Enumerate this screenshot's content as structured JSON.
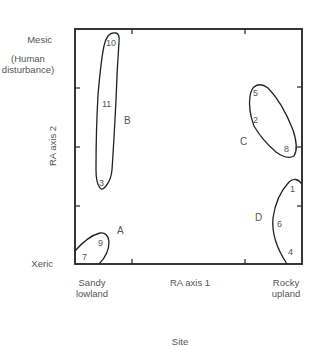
{
  "labels": {
    "y_top": "Mesic",
    "y_top_note": "(Human disturbance)",
    "y_top_note_line1": "(Human",
    "y_top_note_line2": "disturbance)",
    "y_bottom": "Xeric",
    "y_axis": "RA axis 2",
    "x_left_line1": "Sandy",
    "x_left_line2": "lowland",
    "x_axis": "RA axis 1",
    "x_right_line1": "Rocky",
    "x_right_line2": "upland",
    "x_title": "Site"
  },
  "groups": [
    {
      "name": "A",
      "points": [
        "7",
        "9"
      ]
    },
    {
      "name": "B",
      "points": [
        "10",
        "11",
        "3"
      ]
    },
    {
      "name": "C",
      "points": [
        "5",
        "2",
        "8"
      ]
    },
    {
      "name": "D",
      "points": [
        "1",
        "6",
        "4"
      ]
    }
  ],
  "points": {
    "p10": "10",
    "p11": "11",
    "p3": "3",
    "p5": "5",
    "p2": "2",
    "p8": "8",
    "p1": "1",
    "p6": "6",
    "p4": "4",
    "p9": "9",
    "p7": "7"
  },
  "group_labels": {
    "A": "A",
    "B": "B",
    "C": "C",
    "D": "D"
  }
}
